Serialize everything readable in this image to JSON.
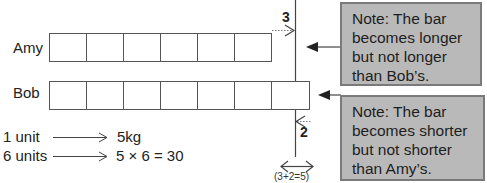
{
  "diagram": {
    "bars": [
      {
        "name": "Amy",
        "units": 6
      },
      {
        "name": "Bob",
        "units": 7
      }
    ],
    "marker_top_label": "3",
    "marker_bottom_label": "2",
    "difference_label": "(3+2=5)",
    "notes": [
      {
        "text": "Note: The bar becomes longer but not longer than Bob’s."
      },
      {
        "text": "Note: The bar becomes shorter but not shorter than Amy’s."
      }
    ],
    "equations": [
      {
        "left": "1 unit",
        "right": "5kg"
      },
      {
        "left": "6 units",
        "right": "5 × 6 = 30"
      }
    ]
  }
}
